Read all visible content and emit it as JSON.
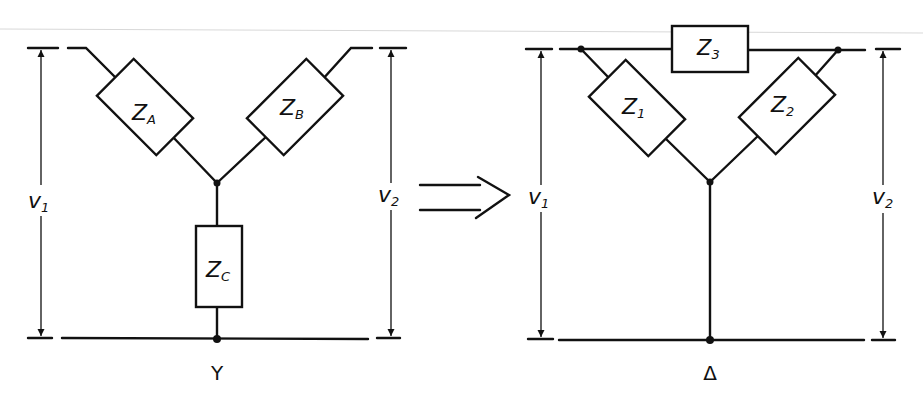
{
  "diagram": {
    "transform_arrow": "⟹",
    "y_network": {
      "caption": "Y",
      "impedances": [
        {
          "id": "ZA",
          "main": "Z",
          "sub": "A"
        },
        {
          "id": "ZB",
          "main": "Z",
          "sub": "B"
        },
        {
          "id": "ZC",
          "main": "Z",
          "sub": "C"
        }
      ],
      "voltages": [
        {
          "id": "v1",
          "main": "v",
          "sub": "1"
        },
        {
          "id": "v2",
          "main": "v",
          "sub": "2"
        }
      ]
    },
    "delta_network": {
      "caption": "Δ",
      "impedances": [
        {
          "id": "Z1",
          "main": "Z",
          "sub": "1"
        },
        {
          "id": "Z2",
          "main": "Z",
          "sub": "2"
        },
        {
          "id": "Z3",
          "main": "Z",
          "sub": "3"
        }
      ],
      "voltages": [
        {
          "id": "v1",
          "main": "v",
          "sub": "1"
        },
        {
          "id": "v2",
          "main": "v",
          "sub": "2"
        }
      ]
    }
  }
}
